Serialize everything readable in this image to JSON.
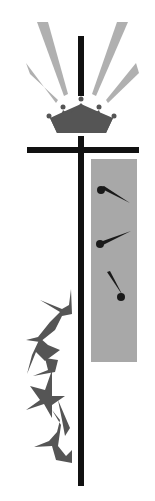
{
  "illustration": {
    "subject": "cross with crown, nails and crown of thorns",
    "colors": {
      "background": "#ffffff",
      "cross": "#111111",
      "crown": "#555555",
      "rays": "#b0b0b0",
      "panel": "#a8a8a8",
      "nails": "#1a1a1a",
      "thorns": "#555555"
    },
    "elements": [
      "rays",
      "crown",
      "cross",
      "gray-panel",
      "nails",
      "thorns"
    ],
    "nail_count": 3,
    "ray_count": 4
  }
}
